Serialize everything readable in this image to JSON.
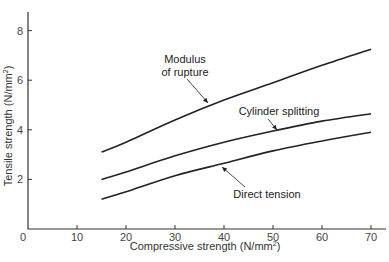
{
  "chart_data": {
    "type": "line",
    "title": "",
    "xlabel": "Compressive strength (N/mm²)",
    "ylabel": "Tensile strength (N/mm²)",
    "xlim": [
      0,
      72
    ],
    "ylim": [
      0,
      8.8
    ],
    "xticks": [
      0,
      10,
      20,
      30,
      40,
      50,
      60,
      70
    ],
    "yticks": [
      0,
      2,
      4,
      6,
      8
    ],
    "grid": false,
    "legend": "none (inline annotations with arrows)",
    "series": [
      {
        "name": "Modulus of rupture",
        "x": [
          15,
          20,
          30,
          40,
          50,
          60,
          70
        ],
        "y": [
          3.1,
          3.5,
          4.4,
          5.2,
          5.9,
          6.6,
          7.25
        ]
      },
      {
        "name": "Cylinder splitting",
        "x": [
          15,
          20,
          30,
          40,
          50,
          60,
          70
        ],
        "y": [
          2.0,
          2.3,
          2.95,
          3.5,
          3.95,
          4.35,
          4.65
        ]
      },
      {
        "name": "Direct tension",
        "x": [
          15,
          20,
          30,
          40,
          50,
          60,
          70
        ],
        "y": [
          1.2,
          1.5,
          2.15,
          2.65,
          3.15,
          3.55,
          3.9
        ]
      }
    ],
    "annotations": [
      {
        "text_lines": [
          "Modulus",
          "of rupture"
        ],
        "series": "Modulus of rupture"
      },
      {
        "text_lines": [
          "Cylinder splitting"
        ],
        "series": "Cylinder splitting"
      },
      {
        "text_lines": [
          "Direct tension"
        ],
        "series": "Direct tension"
      }
    ]
  },
  "labels": {
    "x_axis": "Compressive strength (N/mm",
    "y_axis": "Tensile strength (N/mm",
    "superscript": "2",
    "close_paren": ")"
  }
}
